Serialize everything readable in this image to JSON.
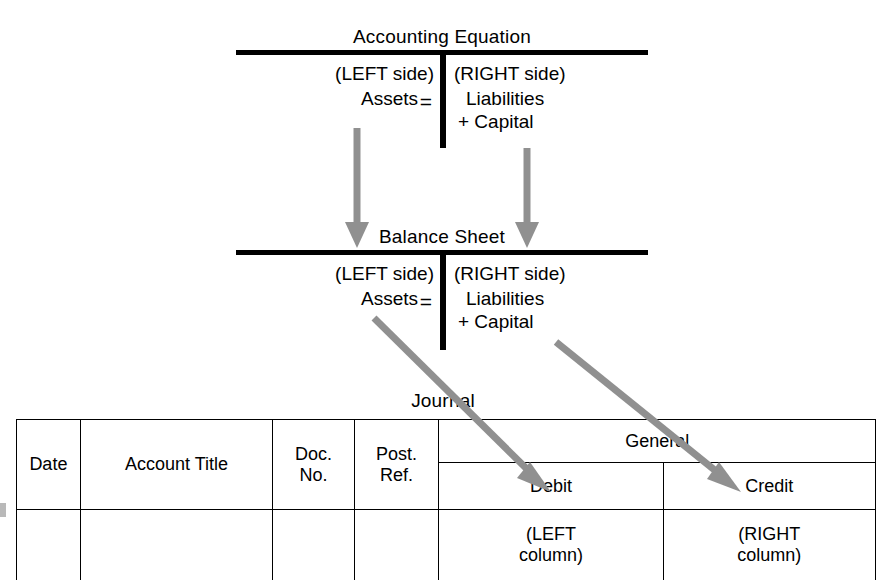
{
  "diagram": {
    "title_accounting_equation": "Accounting Equation",
    "title_balance_sheet": "Balance Sheet",
    "title_journal": "Journal",
    "equation": {
      "left_side_label": "(LEFT side)",
      "left_term": "Assets",
      "equals": "=",
      "right_side_label": "(RIGHT side)",
      "right_term_1": "Liabilities",
      "right_term_2": "+ Capital"
    },
    "balance_sheet": {
      "left_side_label": "(LEFT side)",
      "left_term": "Assets",
      "equals": "=",
      "right_side_label": "(RIGHT side)",
      "right_term_1": "Liabilities",
      "right_term_2": "+ Capital"
    },
    "journal": {
      "group_header": "General",
      "columns": [
        {
          "label": "Date"
        },
        {
          "label": "Account Title"
        },
        {
          "label_line1": "Doc.",
          "label_line2": "No."
        },
        {
          "label_line1": "Post.",
          "label_line2": "Ref."
        },
        {
          "label": "Debit",
          "note_line1": "(LEFT",
          "note_line2": "column)"
        },
        {
          "label": "Credit",
          "note_line1": "(RIGHT",
          "note_line2": "column)"
        }
      ]
    },
    "colors": {
      "ink": "#000000",
      "arrow_gray": "#909090",
      "paper": "#ffffff"
    }
  }
}
